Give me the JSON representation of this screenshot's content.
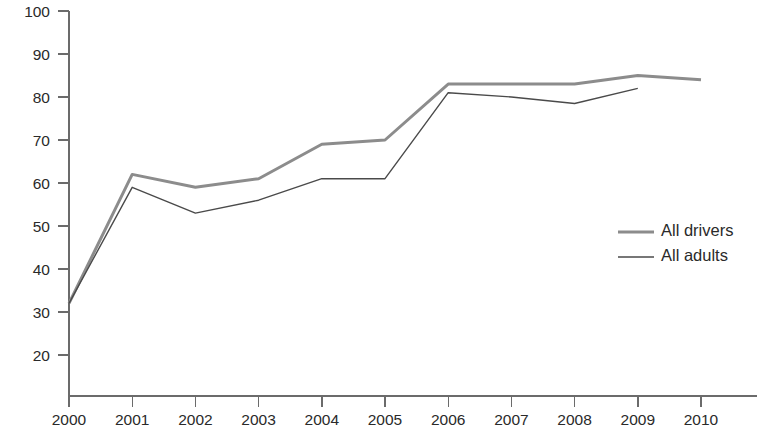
{
  "chart_data": {
    "type": "line",
    "title": "",
    "subtitle": "",
    "xlabel": "",
    "ylabel": "",
    "x": [
      2000,
      2001,
      2002,
      2003,
      2004,
      2005,
      2006,
      2007,
      2008,
      2009,
      2010
    ],
    "categories": [
      "2000",
      "2001",
      "2002",
      "2003",
      "2004",
      "2005",
      "2006",
      "2007",
      "2008",
      "2009",
      "2010"
    ],
    "series": [
      {
        "name": "All drivers",
        "color": "#8c8c8c",
        "line_width": 3,
        "values": [
          32,
          62,
          59,
          61,
          69,
          70,
          83,
          83,
          83,
          85,
          84
        ]
      },
      {
        "name": "All adults",
        "color": "#4a4a4a",
        "line_width": 1.4,
        "values": [
          32,
          59,
          53,
          56,
          61,
          61,
          81,
          80,
          78.5,
          82,
          null
        ]
      }
    ],
    "xlim": [
      2000,
      2010
    ],
    "ylim": [
      10.5,
      100
    ],
    "ytick_values": [
      20,
      30,
      40,
      50,
      60,
      70,
      80,
      90,
      100
    ],
    "ytick_labels": [
      "20",
      "30",
      "40",
      "50",
      "60",
      "70",
      "80",
      "90",
      "100"
    ],
    "xtick_labels": [
      "2000",
      "2001",
      "2002",
      "2003",
      "2004",
      "2005",
      "2006",
      "2007",
      "2008",
      "2009",
      "2010"
    ],
    "grid": false,
    "legend_position": "center-right",
    "legend": [
      {
        "label": "All drivers",
        "color": "#8c8c8c",
        "line_width": 3
      },
      {
        "label": "All adults",
        "color": "#4a4a4a",
        "line_width": 1.4
      }
    ],
    "annotations": []
  },
  "axes": {
    "axis_color": "#6b6b6b",
    "tick_color": "#6b6b6b",
    "label_color": "#2a2a2a"
  }
}
